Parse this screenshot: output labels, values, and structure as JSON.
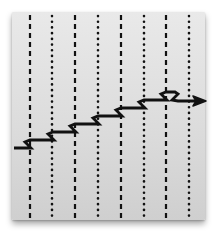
{
  "diagram": {
    "background_color": "#dcdcdc",
    "line_color": "#111111",
    "arrow_color": "#111111",
    "vertical_lines": [
      {
        "x": 30,
        "style": "dashed"
      },
      {
        "x": 52,
        "style": "dotted"
      },
      {
        "x": 75,
        "style": "dashed"
      },
      {
        "x": 98,
        "style": "dotted"
      },
      {
        "x": 121,
        "style": "dashed"
      },
      {
        "x": 144,
        "style": "dotted"
      },
      {
        "x": 166,
        "style": "dashed"
      },
      {
        "x": 189,
        "style": "dotted"
      }
    ],
    "arrow": {
      "direction": "up-right",
      "start": [
        14,
        148
      ],
      "end": [
        206,
        101
      ],
      "steps": 8
    }
  }
}
